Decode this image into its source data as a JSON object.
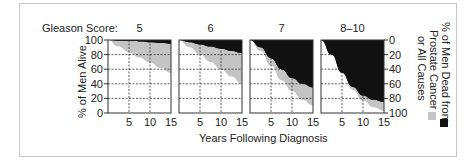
{
  "figure": {
    "score_label": "Gleason Score:",
    "panel_titles": [
      "5",
      "6",
      "7",
      "8–10"
    ],
    "left_axis_label": "% of Men Alive",
    "right_axis_label_line1": "% of Men Dead from",
    "right_axis_label_line2": "Prostate Cancer",
    "right_axis_label_line3": "or All Causes",
    "x_axis_label": "Years Following Diagnosis",
    "left_ticks": [
      "100",
      "80",
      "60",
      "40",
      "20",
      "0"
    ],
    "right_ticks": [
      "0",
      "20",
      "40",
      "60",
      "80",
      "100"
    ],
    "x_ticks": [
      "5",
      "10",
      "15"
    ],
    "colors": {
      "alive": "#ffffff",
      "other_causes": "#c4c4c4",
      "prostate_cancer": "#111111",
      "grid": "#333333"
    }
  },
  "chart_data": {
    "type": "area",
    "xlabel": "Years Following Diagnosis",
    "ylabel": "% of Men Alive",
    "ylabel_right": "% of Men Dead from Prostate Cancer or All Causes",
    "xlim": [
      0,
      15
    ],
    "ylim": [
      0,
      100
    ],
    "x_ticks": [
      5,
      10,
      15
    ],
    "y_ticks": [
      0,
      20,
      40,
      60,
      80,
      100
    ],
    "grid": true,
    "legend": [
      {
        "name": "Dead from Prostate Cancer",
        "color": "#111111"
      },
      {
        "name": "Dead from All (Other) Causes",
        "color": "#c4c4c4"
      }
    ],
    "x": [
      0,
      2.5,
      5,
      7.5,
      10,
      12.5,
      15
    ],
    "panels": [
      {
        "gleason_score": "5",
        "alive_pct": [
          100,
          91,
          83,
          76,
          69,
          62,
          55
        ],
        "not_dead_prostate_cancer_pct": [
          100,
          99,
          98.5,
          98,
          97,
          96,
          95
        ]
      },
      {
        "gleason_score": "6",
        "alive_pct": [
          100,
          90,
          80,
          70,
          60,
          50,
          40
        ],
        "not_dead_prostate_cancer_pct": [
          100,
          97,
          94,
          91,
          88,
          85,
          82
        ]
      },
      {
        "gleason_score": "7",
        "alive_pct": [
          100,
          85,
          65,
          45,
          30,
          18,
          10
        ],
        "not_dead_prostate_cancer_pct": [
          100,
          90,
          75,
          60,
          48,
          40,
          35
        ]
      },
      {
        "gleason_score": "8–10",
        "alive_pct": [
          100,
          82,
          55,
          32,
          17,
          8,
          3
        ],
        "not_dead_prostate_cancer_pct": [
          100,
          80,
          55,
          36,
          24,
          18,
          15
        ]
      }
    ]
  }
}
